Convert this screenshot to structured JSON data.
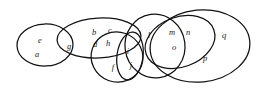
{
  "diagram": {
    "type": "euler-diagram",
    "title": "",
    "canvas": {
      "width": 256,
      "height": 91
    },
    "stroke_color": "#111111",
    "background_color": "#ffffff",
    "label_color": "#1a1a1a",
    "sets": [
      {
        "id": "set-ea",
        "name": "left-ellipse",
        "shape": "ellipse",
        "cx": 45,
        "cy": 45,
        "rx": 28,
        "ry": 21,
        "rotate": -2,
        "members": [
          "e",
          "a"
        ]
      },
      {
        "id": "set-gbcdh",
        "name": "upper-left-wide-ellipse",
        "shape": "ellipse",
        "cx": 99,
        "cy": 38,
        "rx": 42,
        "ry": 20,
        "rotate": -3,
        "members": [
          "g",
          "b",
          "c",
          "d",
          "h"
        ]
      },
      {
        "id": "set-hf",
        "name": "lower-middle-ellipse",
        "shape": "ellipse",
        "cx": 117,
        "cy": 57,
        "rx": 26,
        "ry": 25,
        "rotate": 20,
        "members": [
          "h",
          "f"
        ]
      },
      {
        "id": "set-ij",
        "name": "narrow-vertical-ellipse",
        "shape": "ellipse",
        "cx": 130,
        "cy": 56,
        "rx": 13,
        "ry": 24,
        "rotate": 8,
        "members": [
          "i",
          "j"
        ]
      },
      {
        "id": "set-l",
        "name": "tall-center-ellipse",
        "shape": "ellipse",
        "cx": 155,
        "cy": 46,
        "rx": 30,
        "ry": 32,
        "rotate": -8,
        "members": [
          "l"
        ]
      },
      {
        "id": "set-mno",
        "name": "tilted-right-ellipse",
        "shape": "ellipse",
        "cx": 180,
        "cy": 42,
        "rx": 36,
        "ry": 25,
        "rotate": -20,
        "members": [
          "m",
          "n",
          "o"
        ]
      },
      {
        "id": "set-pq",
        "name": "outer-right-ellipse",
        "shape": "ellipse",
        "cx": 200,
        "cy": 46,
        "rx": 50,
        "ry": 36,
        "rotate": -6,
        "members": [
          "p",
          "q"
        ]
      }
    ],
    "elements": [
      {
        "label": "e",
        "x": 40,
        "y": 41
      },
      {
        "label": "a",
        "x": 37,
        "y": 55
      },
      {
        "label": "g",
        "x": 69,
        "y": 47
      },
      {
        "label": "b",
        "x": 94,
        "y": 33
      },
      {
        "label": "c",
        "x": 110,
        "y": 31
      },
      {
        "label": "d",
        "x": 95,
        "y": 45
      },
      {
        "label": "h",
        "x": 108,
        "y": 44
      },
      {
        "label": "f",
        "x": 113,
        "y": 68
      },
      {
        "label": "i",
        "x": 128,
        "y": 52
      },
      {
        "label": "j",
        "x": 131,
        "y": 66
      },
      {
        "label": "l",
        "x": 149,
        "y": 36
      },
      {
        "label": "m",
        "x": 172,
        "y": 33
      },
      {
        "label": "n",
        "x": 188,
        "y": 33
      },
      {
        "label": "o",
        "x": 174,
        "y": 48
      },
      {
        "label": "p",
        "x": 205,
        "y": 59
      },
      {
        "label": "q",
        "x": 224,
        "y": 36
      }
    ]
  }
}
